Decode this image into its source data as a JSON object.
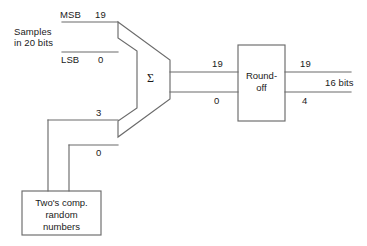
{
  "figure": {
    "type": "block-diagram",
    "title": "",
    "stroke_color": "#6b6b6b",
    "text_color": "#1a1a1a",
    "background_color": "#ffffff"
  },
  "inputs": {
    "source_label_line1": "Samples",
    "source_label_line2": "in 20 bits",
    "msb_label": "MSB",
    "msb_index": "19",
    "lsb_label": "LSB",
    "lsb_index": "0"
  },
  "dither": {
    "box_line1": "Two's comp.",
    "box_line2": "random",
    "box_line3": "numbers",
    "msb_index": "3",
    "lsb_index": "0"
  },
  "adder": {
    "symbol": "Σ"
  },
  "adder_output": {
    "msb_index": "19",
    "lsb_index": "0"
  },
  "roundoff": {
    "box_line1": "Round-",
    "box_line2": "off"
  },
  "output": {
    "msb_index": "19",
    "lsb_index": "4",
    "width_label": "16 bits"
  }
}
